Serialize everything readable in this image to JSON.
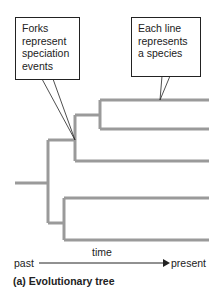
{
  "figure": {
    "caption": "(a) Evolutionary tree",
    "callouts": {
      "forks": "Forks represent speciation events",
      "lines": "Each line represents a species"
    },
    "axis": {
      "label": "time",
      "start": "past",
      "end": "present"
    },
    "colors": {
      "branch": "#9a9a9a",
      "outline": "#222222"
    }
  }
}
